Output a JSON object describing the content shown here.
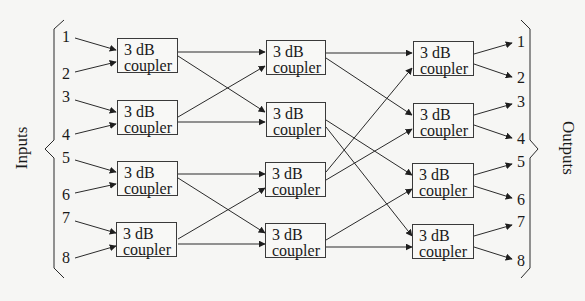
{
  "diagram": {
    "type": "8x8 optical coupler network (three stages of 3 dB couplers)",
    "side_labels": {
      "inputs": "Inputs",
      "outputs": "Outputs"
    },
    "coupler_label_line1": "3 dB",
    "coupler_label_line2": "coupler",
    "inputs": [
      "1",
      "2",
      "3",
      "4",
      "5",
      "6",
      "7",
      "8"
    ],
    "outputs": [
      "1",
      "2",
      "3",
      "4",
      "5",
      "6",
      "7",
      "8"
    ],
    "stages": [
      {
        "name": "stage-1",
        "couplers": 4
      },
      {
        "name": "stage-2",
        "couplers": 4
      },
      {
        "name": "stage-3",
        "couplers": 4
      }
    ],
    "connections_stage1_to_stage2": [
      [
        "S1C1",
        "S2C1"
      ],
      [
        "S1C1",
        "S2C2"
      ],
      [
        "S1C2",
        "S2C1"
      ],
      [
        "S1C2",
        "S2C2"
      ],
      [
        "S1C3",
        "S2C3"
      ],
      [
        "S1C3",
        "S2C4"
      ],
      [
        "S1C4",
        "S2C3"
      ],
      [
        "S1C4",
        "S2C4"
      ]
    ],
    "connections_stage2_to_stage3": [
      [
        "S2C1",
        "S3C1"
      ],
      [
        "S2C1",
        "S3C2"
      ],
      [
        "S2C2",
        "S3C3"
      ],
      [
        "S2C2",
        "S3C4"
      ],
      [
        "S2C3",
        "S3C1"
      ],
      [
        "S2C3",
        "S3C2"
      ],
      [
        "S2C4",
        "S3C3"
      ],
      [
        "S2C4",
        "S3C4"
      ]
    ],
    "colors": {
      "line": "#2a2a2a",
      "background": "#f6f6f4"
    }
  }
}
